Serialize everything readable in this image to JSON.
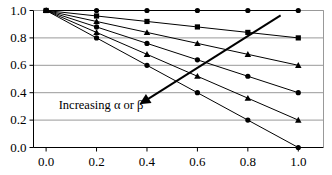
{
  "chart_data": {
    "type": "line",
    "title": "",
    "xlabel": "",
    "ylabel": "",
    "xlim": [
      -0.05,
      1.1
    ],
    "ylim": [
      0.0,
      1.0
    ],
    "grid": true,
    "grid_axis": "y",
    "legend": "none",
    "x": [
      0.0,
      0.2,
      0.4,
      0.6,
      0.8,
      1.0
    ],
    "xticks": [
      "0.0",
      "0.2",
      "0.4",
      "0.6",
      "0.8",
      "1.0"
    ],
    "yticks": [
      "0.0",
      "0.2",
      "0.4",
      "0.6",
      "0.8",
      "1.0"
    ],
    "series": [
      {
        "name": "slope 0.0",
        "marker": "circle",
        "values": [
          1.0,
          1.0,
          1.0,
          1.0,
          1.0,
          1.0
        ]
      },
      {
        "name": "slope -0.2",
        "marker": "square",
        "values": [
          1.0,
          0.96,
          0.92,
          0.88,
          0.84,
          0.8
        ]
      },
      {
        "name": "slope -0.4",
        "marker": "triangle",
        "values": [
          1.0,
          0.92,
          0.84,
          0.76,
          0.68,
          0.6
        ]
      },
      {
        "name": "slope -0.6",
        "marker": "circle",
        "values": [
          1.0,
          0.88,
          0.76,
          0.64,
          0.52,
          0.4
        ]
      },
      {
        "name": "slope -0.8",
        "marker": "triangle",
        "values": [
          1.0,
          0.84,
          0.68,
          0.52,
          0.36,
          0.2
        ]
      },
      {
        "name": "slope -1.0",
        "marker": "circle",
        "values": [
          1.0,
          0.8,
          0.6,
          0.4,
          0.2,
          0.0
        ]
      }
    ],
    "annotations": [
      {
        "text": "Increasing α or β",
        "type": "arrow",
        "arrow_from": [
          0.93,
          0.965
        ],
        "arrow_to": [
          0.37,
          0.315
        ],
        "label_x": 0.05,
        "label_y": 0.305
      }
    ],
    "colors": {
      "line": "#000000",
      "marker": "#000000",
      "grid": "#999999",
      "axis": "#000000",
      "background": "#ffffff"
    }
  }
}
